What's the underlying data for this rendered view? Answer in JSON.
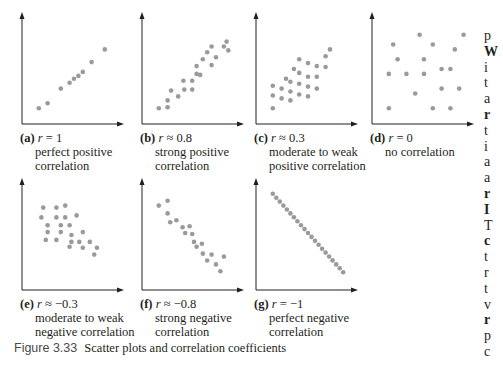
{
  "figure": {
    "number": "Figure 3.33",
    "title": "Scatter plots and correlation coefficients"
  },
  "panels": [
    {
      "label": "(a)",
      "r_symbol": "r",
      "r_rel": "=",
      "r_value": "1",
      "desc1": "perfect positive",
      "desc2": "correlation"
    },
    {
      "label": "(b)",
      "r_symbol": "r",
      "r_rel": "≈",
      "r_value": "0.8",
      "desc1": "strong positive",
      "desc2": "correlation"
    },
    {
      "label": "(c)",
      "r_symbol": "r",
      "r_rel": "≈",
      "r_value": "0.3",
      "desc1": "moderate to weak",
      "desc2": "positive correlation"
    },
    {
      "label": "(d)",
      "r_symbol": "r",
      "r_rel": "=",
      "r_value": "0",
      "desc1": "no correlation",
      "desc2": ""
    },
    {
      "label": "(e)",
      "r_symbol": "r",
      "r_rel": "≈",
      "r_value": "−0.3",
      "desc1": "moderate to weak",
      "desc2": "negative correlation"
    },
    {
      "label": "(f)",
      "r_symbol": "r",
      "r_rel": "≈",
      "r_value": "−0.8",
      "desc1": "strong negative",
      "desc2": "correlation"
    },
    {
      "label": "(g)",
      "r_symbol": "r",
      "r_rel": "=",
      "r_value": "−1",
      "desc1": "perfect negative",
      "desc2": "correlation"
    }
  ],
  "side_text": [
    "p",
    "W",
    "i",
    "t",
    "a",
    "r",
    "t",
    "i",
    "a",
    "a",
    "r",
    "I",
    "T",
    "c",
    "t",
    "r",
    "t",
    "v",
    "r",
    "p",
    "c"
  ],
  "colors": {
    "dot": "#9a9a9a",
    "axis": "#231f20",
    "text": "#231f20"
  },
  "chart_data": [
    {
      "type": "scatter",
      "title": "(a) r = 1",
      "subtitle": "perfect positive correlation",
      "xlabel": "",
      "ylabel": "",
      "grid": false,
      "points": [
        [
          1,
          1
        ],
        [
          2,
          1.5
        ],
        [
          3.5,
          3
        ],
        [
          4.5,
          3.6
        ],
        [
          5,
          4
        ],
        [
          5.5,
          4.3
        ],
        [
          6,
          4.7
        ],
        [
          7,
          5.7
        ],
        [
          8.5,
          7
        ]
      ]
    },
    {
      "type": "scatter",
      "title": "(b) r ≈ 0.8",
      "subtitle": "strong positive correlation",
      "xlabel": "",
      "ylabel": "",
      "grid": false,
      "points": [
        [
          1,
          1
        ],
        [
          2,
          1.1
        ],
        [
          2,
          1.8
        ],
        [
          2.4,
          2.8
        ],
        [
          3.2,
          2.2
        ],
        [
          3.9,
          2.9
        ],
        [
          3.8,
          3.8
        ],
        [
          4.8,
          2.9
        ],
        [
          4.8,
          3.8
        ],
        [
          5.3,
          4.5
        ],
        [
          5.3,
          5.3
        ],
        [
          5.7,
          4.4
        ],
        [
          6,
          6
        ],
        [
          6.5,
          6.7
        ],
        [
          7,
          5.4
        ],
        [
          7,
          7.3
        ],
        [
          7.5,
          6.2
        ],
        [
          8.4,
          7.3
        ],
        [
          8.7,
          7.8
        ],
        [
          8.9,
          6.9
        ]
      ]
    },
    {
      "type": "scatter",
      "title": "(c) r ≈ 0.3",
      "subtitle": "moderate to weak positive correlation",
      "xlabel": "",
      "ylabel": "",
      "grid": false,
      "points": [
        [
          1,
          1
        ],
        [
          1,
          2.3
        ],
        [
          1,
          3.3
        ],
        [
          2,
          2
        ],
        [
          2,
          3
        ],
        [
          2.5,
          4
        ],
        [
          3,
          1.8
        ],
        [
          3,
          2.7
        ],
        [
          3,
          3.7
        ],
        [
          3.4,
          5
        ],
        [
          4,
          2.4
        ],
        [
          4,
          3.5
        ],
        [
          4,
          4.6
        ],
        [
          4,
          6
        ],
        [
          5,
          2.2
        ],
        [
          5,
          3.2
        ],
        [
          5,
          4.2
        ],
        [
          5,
          5.6
        ],
        [
          6,
          3
        ],
        [
          6,
          4.2
        ],
        [
          6,
          5.3
        ],
        [
          7,
          5.2
        ],
        [
          7,
          6.3
        ],
        [
          7.5,
          7
        ]
      ]
    },
    {
      "type": "scatter",
      "title": "(d) r = 0",
      "subtitle": "no correlation",
      "xlabel": "",
      "ylabel": "",
      "grid": false,
      "points": [
        [
          1,
          1
        ],
        [
          1,
          4.5
        ],
        [
          1.5,
          7.5
        ],
        [
          2,
          6
        ],
        [
          3,
          4.5
        ],
        [
          4,
          2.5
        ],
        [
          4.5,
          8.5
        ],
        [
          5,
          4.5
        ],
        [
          5,
          6
        ],
        [
          6,
          1
        ],
        [
          6,
          7.5
        ],
        [
          7,
          5
        ],
        [
          7,
          3
        ],
        [
          8,
          1
        ],
        [
          8,
          5
        ],
        [
          8.5,
          7
        ],
        [
          9,
          3
        ],
        [
          9.5,
          8.5
        ]
      ]
    },
    {
      "type": "scatter",
      "title": "(e) r ≈ −0.3",
      "subtitle": "moderate to weak negative correlation",
      "xlabel": "",
      "ylabel": "",
      "grid": false,
      "points": [
        [
          1.5,
          7.8
        ],
        [
          1.3,
          6.8
        ],
        [
          2,
          5.3
        ],
        [
          2,
          6
        ],
        [
          1.8,
          4.5
        ],
        [
          3,
          7.8
        ],
        [
          3,
          6.8
        ],
        [
          3.5,
          6
        ],
        [
          3.5,
          5.3
        ],
        [
          3,
          4.5
        ],
        [
          4,
          8
        ],
        [
          4,
          6.8
        ],
        [
          4.5,
          6
        ],
        [
          4.7,
          5
        ],
        [
          4.7,
          4.3
        ],
        [
          4.5,
          3.8
        ],
        [
          5.3,
          7
        ],
        [
          5.6,
          4.3
        ],
        [
          6,
          3.7
        ],
        [
          6,
          5.3
        ],
        [
          6.8,
          4.3
        ],
        [
          7.6,
          3.7
        ],
        [
          7.3,
          3
        ]
      ]
    },
    {
      "type": "scatter",
      "title": "(f) r ≈ −0.8",
      "subtitle": "strong negative correlation",
      "xlabel": "",
      "ylabel": "",
      "grid": false,
      "points": [
        [
          1,
          8
        ],
        [
          2,
          8.5
        ],
        [
          2,
          7.2
        ],
        [
          2.3,
          6.3
        ],
        [
          3,
          6.5
        ],
        [
          3.7,
          5.8
        ],
        [
          4,
          5.2
        ],
        [
          4.5,
          5.9
        ],
        [
          4.8,
          5.1
        ],
        [
          5,
          4.3
        ],
        [
          5.3,
          3.8
        ],
        [
          5.9,
          4.1
        ],
        [
          6,
          3.1
        ],
        [
          6.5,
          2.4
        ],
        [
          7,
          3
        ],
        [
          7.5,
          2
        ],
        [
          8,
          1.3
        ],
        [
          8.4,
          2.8
        ]
      ]
    },
    {
      "type": "scatter",
      "title": "(g) r = −1",
      "subtitle": "perfect negative correlation",
      "xlabel": "",
      "ylabel": "",
      "grid": false,
      "points": [
        [
          1,
          9
        ],
        [
          1.4,
          8.6
        ],
        [
          1.8,
          8.2
        ],
        [
          2.2,
          7.8
        ],
        [
          2.6,
          7.4
        ],
        [
          3,
          7
        ],
        [
          3.4,
          6.6
        ],
        [
          3.8,
          6.2
        ],
        [
          4.2,
          5.8
        ],
        [
          4.6,
          5.4
        ],
        [
          5,
          5
        ],
        [
          5.4,
          4.6
        ],
        [
          5.8,
          4.2
        ],
        [
          6.2,
          3.8
        ],
        [
          6.6,
          3.4
        ],
        [
          7,
          3
        ],
        [
          7.4,
          2.6
        ],
        [
          7.8,
          2.2
        ],
        [
          8.2,
          1.8
        ],
        [
          8.6,
          1.4
        ],
        [
          9,
          1
        ]
      ]
    }
  ]
}
